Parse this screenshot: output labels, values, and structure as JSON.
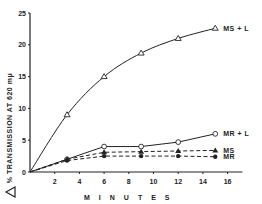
{
  "chart_data": {
    "type": "line",
    "title": "",
    "xlabel": "M I N U T E S",
    "ylabel": "% TRANSMISSION AT 620 mμ",
    "ylabel_prefix_symbol": "Δ",
    "xlim": [
      0,
      16
    ],
    "ylim": [
      0,
      25
    ],
    "x_ticks": [
      "2",
      "4",
      "6",
      "8",
      "10",
      "12",
      "14",
      "16"
    ],
    "y_ticks": [
      "0",
      "5",
      "10",
      "15",
      "20",
      "25"
    ],
    "grid": false,
    "legend_position": "inline-right",
    "series": [
      {
        "name": "MS + L",
        "marker": "open-triangle",
        "line": "solid",
        "x": [
          0,
          3,
          6,
          9,
          12,
          15
        ],
        "y": [
          0,
          9,
          15,
          18.7,
          21,
          22.6
        ]
      },
      {
        "name": "MR + L",
        "marker": "open-circle",
        "line": "solid",
        "x": [
          0,
          3,
          6,
          9,
          12,
          15
        ],
        "y": [
          0,
          2,
          4,
          4,
          4.7,
          6
        ]
      },
      {
        "name": "MS",
        "marker": "filled-triangle",
        "line": "dashed",
        "x": [
          0,
          3,
          6,
          9,
          12,
          15
        ],
        "y": [
          0,
          2,
          3.1,
          3.2,
          3.3,
          3.4
        ]
      },
      {
        "name": "MR",
        "marker": "filled-circle",
        "line": "dashed",
        "x": [
          0,
          3,
          6,
          9,
          12,
          15
        ],
        "y": [
          0,
          1.8,
          2.5,
          2.5,
          2.5,
          2.4
        ]
      }
    ]
  }
}
